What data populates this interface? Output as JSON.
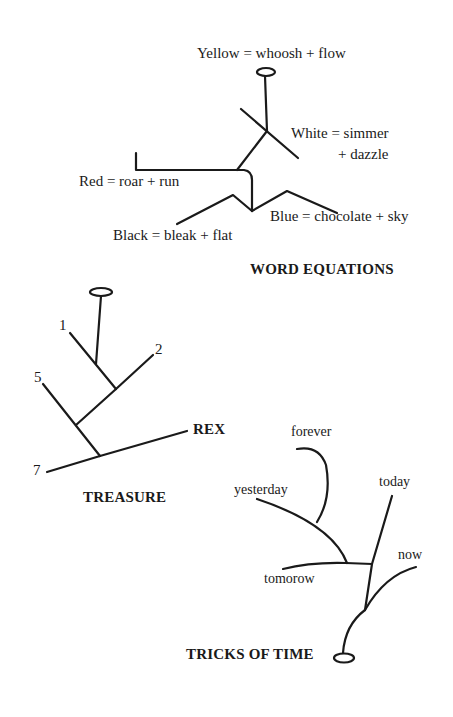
{
  "diagrams": {
    "word_equations": {
      "title": "WORD EQUATIONS",
      "labels": {
        "yellow": "Yellow = whoosh + flow",
        "white_line1": "White = simmer",
        "white_line2": "+ dazzle",
        "red": "Red = roar + run",
        "blue": "Blue = chocolate + sky",
        "black": "Black = bleak + flat"
      }
    },
    "treasure": {
      "title": "TREASURE",
      "labels": {
        "n1": "1",
        "n2": "2",
        "n5": "5",
        "n7": "7",
        "rex": "REX"
      }
    },
    "tricks_of_time": {
      "title": "TRICKS OF TIME",
      "labels": {
        "forever": "forever",
        "yesterday": "yesterday",
        "today": "today",
        "now": "now",
        "tomorrow": "tomorow"
      }
    }
  },
  "colors": {
    "ink": "#1a1a1a",
    "background": "#ffffff"
  }
}
